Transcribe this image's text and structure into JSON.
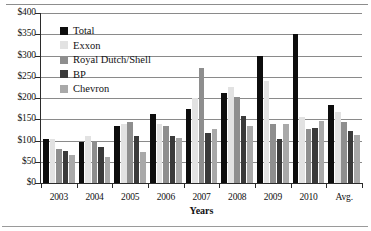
{
  "chart_data": {
    "type": "bar",
    "title": "",
    "xlabel": "Years",
    "ylabel": "",
    "ylim": [
      0,
      400
    ],
    "ytick_step": 50,
    "ytick_labels": [
      "$400",
      "$350",
      "$300",
      "$250",
      "$200",
      "$150",
      "$100",
      "$50",
      "$0"
    ],
    "ytick_values": [
      400,
      350,
      300,
      250,
      200,
      150,
      100,
      50,
      0
    ],
    "grid": true,
    "legend_position": "upper-left-inside",
    "categories": [
      "2003",
      "2004",
      "2005",
      "2006",
      "2007",
      "2008",
      "2009",
      "2010",
      "Avg."
    ],
    "series": [
      {
        "name": "Total",
        "color": "#0d0d0d",
        "values": [
          103,
          97,
          133,
          163,
          175,
          212,
          300,
          350,
          183
        ]
      },
      {
        "name": "Exxon",
        "color": "#e2e2e2",
        "values": [
          103,
          110,
          140,
          140,
          200,
          225,
          240,
          155,
          168
        ]
      },
      {
        "name": "Royal Dutch/Shell",
        "color": "#8e8e8e",
        "values": [
          80,
          100,
          143,
          135,
          270,
          203,
          138,
          128,
          144
        ]
      },
      {
        "name": "BP",
        "color": "#3a3a3a",
        "values": [
          75,
          85,
          110,
          110,
          118,
          158,
          103,
          130,
          123
        ]
      },
      {
        "name": "Chevron",
        "color": "#a9a9a9",
        "values": [
          65,
          62,
          72,
          105,
          128,
          135,
          138,
          145,
          113
        ]
      }
    ]
  },
  "legend": {
    "items": [
      {
        "label": "Total"
      },
      {
        "label": "Exxon"
      },
      {
        "label": "Royal Dutch/Shell"
      },
      {
        "label": "BP"
      },
      {
        "label": "Chevron"
      }
    ]
  }
}
